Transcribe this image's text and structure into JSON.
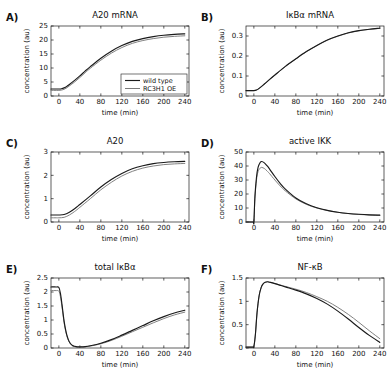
{
  "figure": {
    "xlabel": "time (min)",
    "ylabel": "concentration (au)",
    "xticks": [
      0,
      40,
      80,
      120,
      160,
      200,
      240
    ],
    "xlim": [
      -15,
      248
    ],
    "series_colors": {
      "wild_type": "#1a1a1a",
      "rc3h1_oe": "#7a7a7a"
    },
    "legend": {
      "wild_type_label": "wild type",
      "rc3h1_oe_label": "RC3H1 OE"
    }
  },
  "chart_data": [
    {
      "panel": "A)",
      "type": "line",
      "title": "A20 mRNA",
      "xlabel": "time (min)",
      "ylabel": "concentration (au)",
      "xlim": [
        -15,
        248
      ],
      "ylim": [
        0,
        25
      ],
      "xticks": [
        0,
        40,
        80,
        120,
        160,
        200,
        240
      ],
      "yticks": [
        0,
        5,
        10,
        15,
        20,
        25
      ],
      "ytick_labels": [
        "0",
        "5",
        "10",
        "15",
        "20",
        "25"
      ],
      "grid": false,
      "legend_position": "lower right",
      "x": [
        -15,
        -10,
        -5,
        0,
        5,
        10,
        15,
        20,
        30,
        40,
        50,
        60,
        80,
        100,
        120,
        140,
        160,
        180,
        200,
        220,
        240
      ],
      "series": [
        {
          "name": "wild type",
          "values": [
            2.5,
            2.5,
            2.5,
            2.5,
            2.6,
            2.9,
            3.4,
            4.1,
            5.6,
            7.2,
            8.9,
            10.5,
            13.5,
            16.0,
            18.0,
            19.5,
            20.5,
            21.2,
            21.7,
            22.0,
            22.2
          ]
        },
        {
          "name": "RC3H1 OE",
          "values": [
            2.0,
            2.0,
            2.0,
            2.0,
            2.1,
            2.4,
            2.9,
            3.6,
            5.0,
            6.6,
            8.3,
            9.9,
            12.8,
            15.3,
            17.3,
            18.8,
            19.8,
            20.5,
            21.0,
            21.3,
            21.5
          ]
        }
      ]
    },
    {
      "panel": "B)",
      "type": "line",
      "title": "IκBα mRNA",
      "xlabel": "time (min)",
      "ylabel": "concentration (au)",
      "xlim": [
        -15,
        248
      ],
      "ylim": [
        0,
        0.35
      ],
      "xticks": [
        0,
        40,
        80,
        120,
        160,
        200,
        240
      ],
      "yticks": [
        0,
        0.1,
        0.2,
        0.3
      ],
      "ytick_labels": [
        "0",
        "0.1",
        "0.2",
        "0.3"
      ],
      "grid": false,
      "legend_position": "none",
      "x": [
        -15,
        -10,
        -5,
        0,
        5,
        10,
        20,
        30,
        40,
        60,
        80,
        100,
        120,
        140,
        160,
        180,
        200,
        220,
        240
      ],
      "series": [
        {
          "name": "wild type",
          "values": [
            0.027,
            0.027,
            0.027,
            0.027,
            0.03,
            0.038,
            0.06,
            0.083,
            0.105,
            0.148,
            0.186,
            0.222,
            0.253,
            0.28,
            0.3,
            0.316,
            0.327,
            0.334,
            0.339
          ]
        },
        {
          "name": "RC3H1 OE",
          "values": [
            0.027,
            0.027,
            0.027,
            0.027,
            0.03,
            0.038,
            0.059,
            0.082,
            0.104,
            0.147,
            0.185,
            0.221,
            0.252,
            0.279,
            0.299,
            0.315,
            0.326,
            0.333,
            0.338
          ]
        }
      ]
    },
    {
      "panel": "C)",
      "type": "line",
      "title": "A20",
      "xlabel": "time (min)",
      "ylabel": "concentration (au)",
      "xlim": [
        -15,
        248
      ],
      "ylim": [
        0,
        3
      ],
      "xticks": [
        0,
        40,
        80,
        120,
        160,
        200,
        240
      ],
      "yticks": [
        0,
        1,
        2,
        3
      ],
      "ytick_labels": [
        "0",
        "1",
        "2",
        "3"
      ],
      "grid": false,
      "legend_position": "none",
      "x": [
        -15,
        -10,
        -5,
        0,
        10,
        20,
        30,
        40,
        60,
        80,
        100,
        120,
        140,
        160,
        180,
        200,
        220,
        240
      ],
      "series": [
        {
          "name": "wild type",
          "values": [
            0.3,
            0.3,
            0.3,
            0.3,
            0.32,
            0.42,
            0.57,
            0.75,
            1.12,
            1.5,
            1.82,
            2.08,
            2.28,
            2.41,
            2.5,
            2.55,
            2.58,
            2.6
          ]
        },
        {
          "name": "RC3H1 OE",
          "values": [
            0.18,
            0.18,
            0.18,
            0.18,
            0.2,
            0.3,
            0.45,
            0.63,
            1.0,
            1.38,
            1.7,
            1.97,
            2.17,
            2.31,
            2.4,
            2.46,
            2.49,
            2.51
          ]
        }
      ]
    },
    {
      "panel": "D)",
      "type": "line",
      "title": "active IKK",
      "xlabel": "time (min)",
      "ylabel": "concentration (au)",
      "xlim": [
        -15,
        248
      ],
      "ylim": [
        0,
        50
      ],
      "xticks": [
        0,
        40,
        80,
        120,
        160,
        200,
        240
      ],
      "yticks": [
        0,
        10,
        20,
        30,
        40,
        50
      ],
      "ytick_labels": [
        "0",
        "10",
        "20",
        "30",
        "40",
        "50"
      ],
      "grid": false,
      "legend_position": "none",
      "x": [
        -15,
        -2,
        0,
        2,
        5,
        8,
        12,
        15,
        20,
        25,
        30,
        40,
        50,
        60,
        80,
        100,
        120,
        140,
        160,
        180,
        200,
        220,
        240
      ],
      "series": [
        {
          "name": "wild type",
          "values": [
            0,
            0,
            0,
            18,
            32,
            39,
            42.5,
            43.2,
            42.2,
            40.2,
            37.8,
            32.5,
            27.6,
            23.5,
            17.2,
            13.0,
            10.2,
            8.3,
            7.0,
            6.1,
            5.5,
            5.1,
            4.9
          ]
        },
        {
          "name": "RC3H1 OE",
          "values": [
            0,
            0,
            0,
            17,
            30,
            36,
            38.5,
            39.0,
            38.2,
            36.5,
            34.5,
            30.0,
            25.8,
            22.2,
            16.5,
            12.6,
            10.0,
            8.2,
            6.9,
            6.0,
            5.4,
            5.0,
            4.8
          ]
        }
      ]
    },
    {
      "panel": "E)",
      "type": "line",
      "title": "total IκBα",
      "xlabel": "time (min)",
      "ylabel": "concentration (au)",
      "xlim": [
        -15,
        248
      ],
      "ylim": [
        0,
        2.5
      ],
      "xticks": [
        0,
        40,
        80,
        120,
        160,
        200,
        240
      ],
      "yticks": [
        0,
        0.5,
        1,
        1.5,
        2,
        2.5
      ],
      "ytick_labels": [
        "0",
        "0.5",
        "1",
        "1.5",
        "2",
        "2.5"
      ],
      "grid": false,
      "legend_position": "none",
      "x": [
        -15,
        -5,
        0,
        3,
        6,
        10,
        14,
        18,
        22,
        26,
        30,
        35,
        40,
        50,
        60,
        80,
        100,
        120,
        140,
        160,
        180,
        200,
        220,
        240
      ],
      "series": [
        {
          "name": "wild type",
          "values": [
            2.18,
            2.18,
            2.16,
            1.95,
            1.55,
            0.95,
            0.55,
            0.3,
            0.16,
            0.09,
            0.06,
            0.04,
            0.04,
            0.05,
            0.08,
            0.17,
            0.3,
            0.46,
            0.63,
            0.8,
            0.97,
            1.12,
            1.25,
            1.35
          ]
        },
        {
          "name": "RC3H1 OE",
          "values": [
            2.05,
            2.05,
            2.03,
            1.83,
            1.46,
            0.9,
            0.52,
            0.28,
            0.15,
            0.08,
            0.05,
            0.035,
            0.035,
            0.045,
            0.07,
            0.15,
            0.27,
            0.42,
            0.58,
            0.74,
            0.9,
            1.05,
            1.18,
            1.28
          ]
        }
      ]
    },
    {
      "panel": "F)",
      "type": "line",
      "title": "NF-κB",
      "xlabel": "time (min)",
      "ylabel": "concentration (au)",
      "xlim": [
        -15,
        248
      ],
      "ylim": [
        0,
        1.5
      ],
      "xticks": [
        0,
        40,
        80,
        120,
        160,
        200,
        240
      ],
      "yticks": [
        0,
        0.5,
        1,
        1.5
      ],
      "ytick_labels": [
        "0",
        "0.5",
        "1",
        "1.5"
      ],
      "grid": false,
      "legend_position": "none",
      "x": [
        -15,
        -2,
        0,
        3,
        6,
        10,
        14,
        18,
        22,
        26,
        30,
        40,
        60,
        80,
        100,
        120,
        140,
        160,
        180,
        200,
        220,
        240
      ],
      "series": [
        {
          "name": "wild type",
          "values": [
            0.02,
            0.02,
            0.03,
            0.3,
            0.75,
            1.12,
            1.3,
            1.38,
            1.41,
            1.42,
            1.41,
            1.38,
            1.31,
            1.24,
            1.16,
            1.06,
            0.94,
            0.79,
            0.62,
            0.44,
            0.27,
            0.12
          ]
        },
        {
          "name": "RC3H1 OE",
          "values": [
            0.02,
            0.02,
            0.03,
            0.3,
            0.75,
            1.12,
            1.3,
            1.38,
            1.41,
            1.42,
            1.41,
            1.38,
            1.32,
            1.26,
            1.19,
            1.1,
            1.0,
            0.87,
            0.72,
            0.55,
            0.37,
            0.2
          ]
        }
      ]
    }
  ]
}
